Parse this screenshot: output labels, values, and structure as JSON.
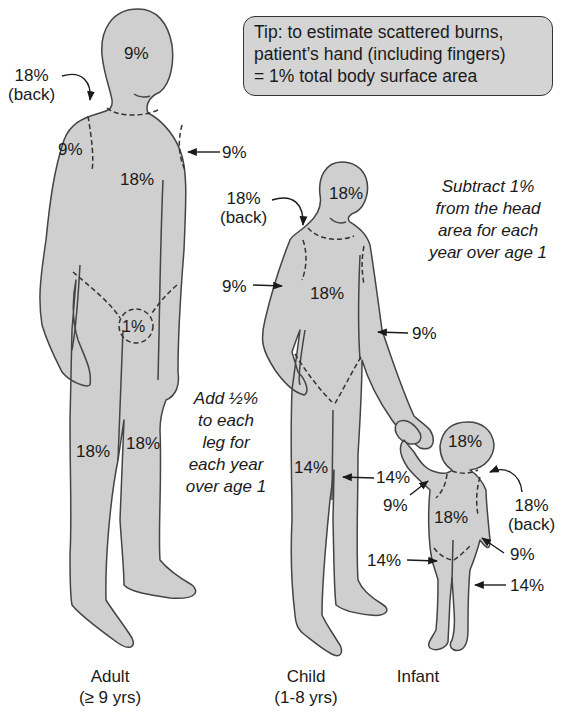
{
  "colors": {
    "figure_fill": "#cfcfcf",
    "figure_stroke": "#444444",
    "tip_fill": "#d4d4d4",
    "text": "#1a1a1a"
  },
  "tip_box": {
    "line1": "Tip: to estimate scattered burns,",
    "line2": "patient’s hand (including fingers)",
    "line3": "= 1% total body surface area"
  },
  "notes": {
    "head_rule": {
      "line1": "Subtract 1%",
      "line2": "from the head",
      "line3": "area for each",
      "line4": "year over age 1"
    },
    "leg_rule": {
      "line1": "Add ½%",
      "line2": "to each",
      "line3": "leg for",
      "line4": "each year",
      "line5": "over age 1"
    }
  },
  "figures": {
    "adult": {
      "caption": "Adult",
      "age": "(≥ 9 yrs)",
      "labels": {
        "head": "9%",
        "back": "18%",
        "back_sub": "(back)",
        "left_arm": "9%",
        "right_arm": "9%",
        "trunk": "18%",
        "genitals": "1%",
        "left_leg": "18%",
        "right_leg": "18%"
      }
    },
    "child": {
      "caption": "Child",
      "age": "(1-8 yrs)",
      "labels": {
        "head": "18%",
        "back": "18%",
        "back_sub": "(back)",
        "left_arm": "9%",
        "right_arm": "9%",
        "trunk": "18%",
        "left_leg": "14%",
        "right_leg": "14%"
      }
    },
    "infant": {
      "caption": "Infant",
      "labels": {
        "head": "18%",
        "back": "18%",
        "back_sub": "(back)",
        "left_arm": "9%",
        "right_arm": "9%",
        "trunk": "18%",
        "left_leg": "14%",
        "right_leg": "14%"
      }
    }
  }
}
